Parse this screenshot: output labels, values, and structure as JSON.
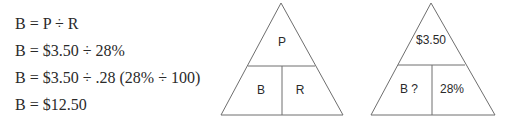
{
  "equations": [
    "B = P ÷ R",
    "B = $3.50 ÷ 28%",
    "B = $3.50 ÷ .28 (28% ÷ 100)",
    "B = $12.50"
  ],
  "triangle_formula": {
    "top": "P",
    "bottom_left": "B",
    "bottom_right": "R"
  },
  "triangle_solved": {
    "top": "$3.50",
    "bottom_left": "B ?",
    "bottom_right": "28%"
  },
  "colors": {
    "line": "#6e6e6e",
    "text": "#2a2a2a"
  }
}
